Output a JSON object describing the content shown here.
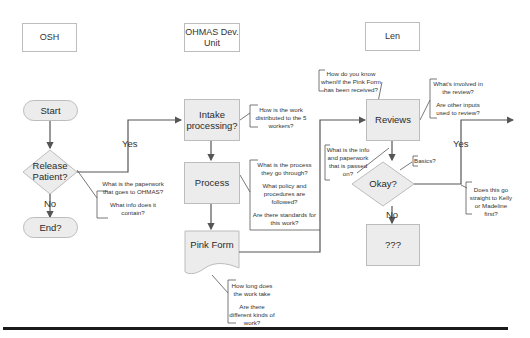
{
  "swimlanes": [
    {
      "id": "osh",
      "label": "OSH"
    },
    {
      "id": "ohmas",
      "label": "OHMAS Dev. Unit"
    },
    {
      "id": "len",
      "label": "Len"
    }
  ],
  "nodes": {
    "start": {
      "type": "terminal",
      "label": "Start"
    },
    "release_patient": {
      "type": "decision",
      "label": "Release Patient?"
    },
    "end": {
      "type": "terminal",
      "label": "End?"
    },
    "intake": {
      "type": "process",
      "label": "Intake processing?"
    },
    "process": {
      "type": "process",
      "label": "Process"
    },
    "pink_form": {
      "type": "document",
      "label": "Pink Form"
    },
    "reviews": {
      "type": "process",
      "label": "Reviews"
    },
    "okay": {
      "type": "decision",
      "label": "Okay?"
    },
    "unknown": {
      "type": "process",
      "label": "???"
    }
  },
  "edges": [
    {
      "from": "start",
      "to": "release_patient",
      "label": ""
    },
    {
      "from": "release_patient",
      "to": "intake",
      "label": "Yes"
    },
    {
      "from": "release_patient",
      "to": "end",
      "label": "No"
    },
    {
      "from": "intake",
      "to": "process",
      "label": ""
    },
    {
      "from": "process",
      "to": "pink_form",
      "label": ""
    },
    {
      "from": "pink_form",
      "to": "reviews",
      "label": ""
    },
    {
      "from": "reviews",
      "to": "okay",
      "label": ""
    },
    {
      "from": "okay",
      "to": "offpage",
      "label": "Yes"
    },
    {
      "from": "okay",
      "to": "unknown",
      "label": "No"
    }
  ],
  "edge_labels": {
    "release_yes": "Yes",
    "release_no": "No",
    "okay_yes": "Yes",
    "okay_no": "No"
  },
  "annotations": {
    "release_patient": [
      "What is the paperwork that goes to OHMAS?",
      "What info does it contain?"
    ],
    "intake": [
      "How is the work distributed to the 5 workers?"
    ],
    "process": [
      "What is the process they go through?",
      "What policy and procedures are followed?",
      "Are there standards for this work?"
    ],
    "pink_form": [
      "How long does the work take",
      "Are there different kinds of work?"
    ],
    "reviews_top": [
      "How do you know when/if the Pink Form has been received?"
    ],
    "reviews_right": [
      "What's involved in the review?",
      "Are other inputs used to review?"
    ],
    "pink_to_reviews": [
      "What is the info and paperwork that is passed on?"
    ],
    "okay_basics": [
      "Basics?"
    ],
    "okay_yes": [
      "Does this go straight to Kelly or Madeline first?"
    ]
  },
  "colors": {
    "shape_fill": "#ececec",
    "shape_border": "#bcbcbc",
    "connector": "#555555",
    "bottom_rule": "#1a1a1a"
  }
}
